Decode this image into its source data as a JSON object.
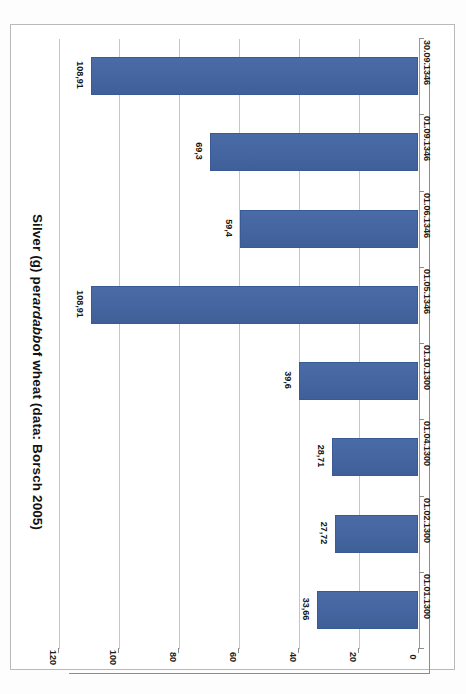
{
  "chart_data": {
    "type": "bar",
    "orientation": "horizontal",
    "title": "Silver (g) per ardabb of wheat (data: Borsch 2005)",
    "title_parts": {
      "before_italic": "Silver (g) per ",
      "italic": "ardabb",
      "after_italic": " of wheat (data: Borsch 2005)"
    },
    "xlabel": "",
    "ylabel": "",
    "categories": [
      "30.09.1346",
      "01.09.1346",
      "01.06.1346",
      "01.05.1346",
      "01.10.1300",
      "01.04.1300",
      "01.02.1300",
      "01.01.1300"
    ],
    "values": [
      108.91,
      69.3,
      59.4,
      108.91,
      39.6,
      28.71,
      27.72,
      33.66
    ],
    "value_labels": [
      "108,91",
      "69,3",
      "59,4",
      "108,91",
      "39,6",
      "28,71",
      "27,72",
      "33,66"
    ],
    "value_axis_ticks": [
      "120",
      "100",
      "80",
      "60",
      "40",
      "20",
      "0"
    ],
    "value_axis_tick_values": [
      120,
      100,
      80,
      60,
      40,
      20,
      0
    ],
    "xlim": [
      0,
      120
    ],
    "axis_direction": "reversed (0 at right, 120 at left)",
    "grid": true,
    "legend": false,
    "series_color": "#44659F",
    "gridline_color": "#C6C6C6",
    "axis_color": "#8C8C8C",
    "text_color": "#1B1B1B"
  }
}
